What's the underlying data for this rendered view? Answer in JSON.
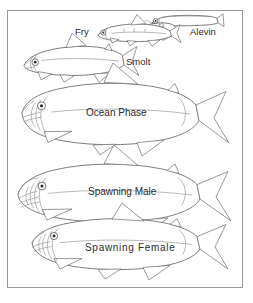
{
  "figure": {
    "background_color": "#ffffff",
    "line_color": "#6e6e70",
    "text_color": "#2b2b2e",
    "border_color": "#9a9a9d",
    "width": 253,
    "height": 303
  },
  "border": {
    "name": "figure-border",
    "x": 7,
    "y": 10,
    "width": 236,
    "height": 278
  },
  "stages": [
    {
      "id": "alevin",
      "label": "Alevin",
      "order": 1,
      "description": "newly hatched with yolk sac",
      "label_x": 190,
      "label_y": 27,
      "font_size": 9.5
    },
    {
      "id": "fry",
      "label": "Fry",
      "order": 2,
      "description": "juvenile free-swimming stage",
      "label_x": 75,
      "label_y": 27,
      "font_size": 9.5
    },
    {
      "id": "smolt",
      "label": "Smolt",
      "order": 3,
      "description": "seaward migrating juvenile",
      "label_x": 126,
      "label_y": 57,
      "font_size": 9.5
    },
    {
      "id": "ocean-phase",
      "label": "Ocean Phase",
      "order": 4,
      "description": "silver adult at sea",
      "label_x": 86,
      "label_y": 108,
      "font_size": 10
    },
    {
      "id": "spawning-male",
      "label": "Spawning Male",
      "order": 5,
      "description": "adult male with hooked kype",
      "label_x": 88,
      "label_y": 187,
      "font_size": 10
    },
    {
      "id": "spawning-female",
      "label": "Spawning Female",
      "order": 6,
      "description": "adult female returning to spawn",
      "label_x": 85,
      "label_y": 243,
      "font_size": 10
    }
  ]
}
